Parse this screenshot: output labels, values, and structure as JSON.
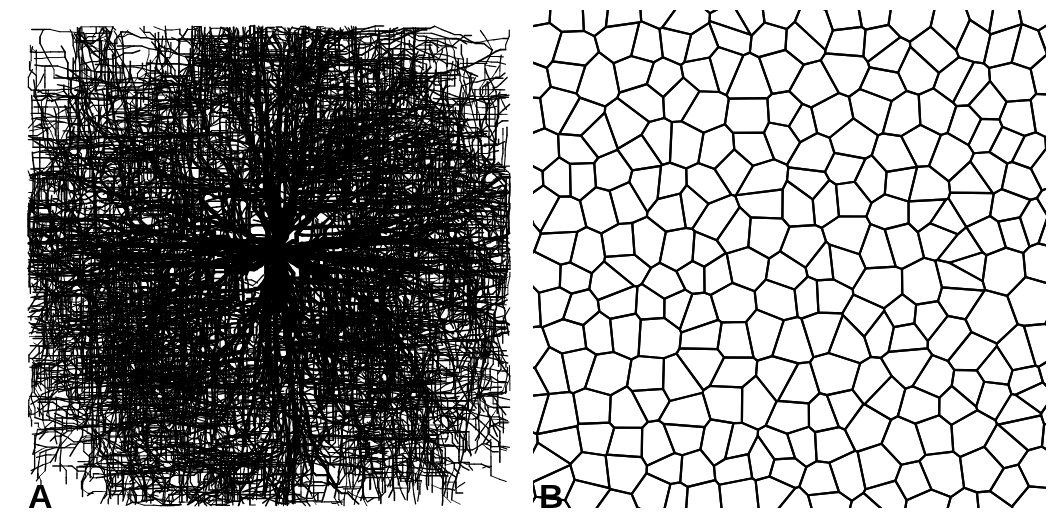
{
  "figure": {
    "width": 1061,
    "height": 530,
    "background_color": "#ffffff",
    "ink_color": "#000000",
    "panel_count": 2,
    "caption_style": "bold uppercase letter, lower-left of each panel"
  },
  "panels": [
    {
      "id": "A",
      "label": "A",
      "label_position": {
        "x": 28,
        "y": 479
      },
      "label_font_size_px": 34,
      "pattern_name": "diffusion-limited-aggregation-cluster",
      "description": "Dense radial dendritic branching cluster grown from a single central seed; jagged stepped filaments, thick near the core and tapering to fine tips at the periphery.",
      "bounds": {
        "x": 0,
        "y": 0,
        "width": 512,
        "height": 530
      },
      "content_bounds": {
        "x": 28,
        "y": 26,
        "width": 482,
        "height": 480
      },
      "seed_center": {
        "x": 278,
        "y": 252
      },
      "primary_branch_count": 52,
      "max_generations": 5,
      "line_width_trunk_px": 5,
      "line_width_tip_px": 1.6,
      "step_length_px": 7,
      "jaggedness": 0.55,
      "branch_probability": 0.3,
      "radial_extent_px": 250
    },
    {
      "id": "B",
      "label": "B",
      "label_position": {
        "x": 27,
        "y": 479
      },
      "label_font_size_px": 34,
      "pattern_name": "voronoi-foam-tessellation",
      "description": "Two-dimensional random cellular / Voronoi foam: convex polygonal cells meeting mostly at three-fold vertices, with dangling truncated edges along the clipped border.",
      "bounds": {
        "x": 512,
        "y": 0,
        "width": 549,
        "height": 530
      },
      "content_bounds": {
        "x": 25,
        "y": 14,
        "width": 505,
        "height": 490
      },
      "cell_count": 236,
      "mean_cell_diameter_px": 31,
      "edge_line_width_px": 2.2,
      "lattice_jitter": 0.42,
      "grid_columns": 17,
      "grid_rows": 16
    }
  ]
}
